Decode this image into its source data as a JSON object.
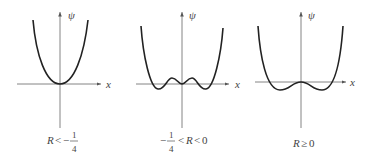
{
  "panels": [
    {
      "id": "panel-1",
      "y_axis_label": "ψ",
      "x_axis_label": "x",
      "caption": {
        "lhs": "R",
        "rel": "<",
        "sign": "−",
        "num": "1",
        "den": "4"
      },
      "description": "Single-well parabola-like potential with minimum at origin"
    },
    {
      "id": "panel-2",
      "y_axis_label": "ψ",
      "x_axis_label": "x",
      "caption": {
        "sign": "−",
        "num": "1",
        "den": "4",
        "rel1": "<",
        "mid": "R",
        "rel2": "<",
        "rhs": "0"
      },
      "description": "Triple-well potential: two outer minima, local max bumps, central local minimum at origin"
    },
    {
      "id": "panel-3",
      "y_axis_label": "ψ",
      "x_axis_label": "x",
      "caption": {
        "lhs": "R",
        "rel": "≥",
        "rhs": "0"
      },
      "description": "Double-well potential with flat local maximum at origin"
    }
  ]
}
